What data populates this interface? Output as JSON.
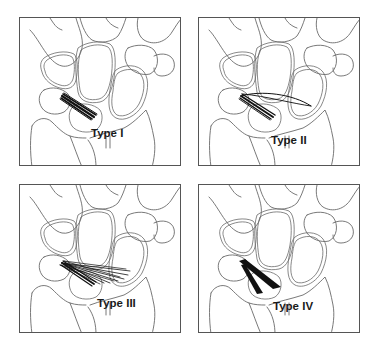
{
  "figure": {
    "panels": [
      {
        "id": "type-1",
        "label": "Type I",
        "position": "top-left"
      },
      {
        "id": "type-2",
        "label": "Type II",
        "position": "top-right"
      },
      {
        "id": "type-3",
        "label": "Type III",
        "position": "bottom-left"
      },
      {
        "id": "type-4",
        "label": "Type IV",
        "position": "bottom-right"
      }
    ]
  },
  "colors": {
    "bone_outline": "#6a6a6a",
    "ligament": "#111111",
    "panel_border": "#555555",
    "background": "#ffffff"
  }
}
